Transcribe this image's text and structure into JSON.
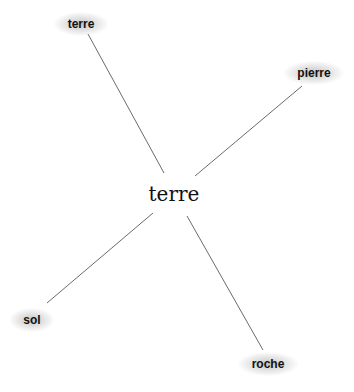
{
  "center": {
    "label": "terre",
    "x": 174,
    "y": 194
  },
  "nodes": [
    {
      "id": "n1",
      "label": "terre",
      "x": 81,
      "y": 24,
      "edge": {
        "x1": 88,
        "y1": 34,
        "x2": 164,
        "y2": 173
      }
    },
    {
      "id": "n2",
      "label": "pierre",
      "x": 314,
      "y": 73,
      "edge": {
        "x1": 302,
        "y1": 86,
        "x2": 195,
        "y2": 176
      }
    },
    {
      "id": "n3",
      "label": "sol",
      "x": 32,
      "y": 320,
      "edge": {
        "x1": 47,
        "y1": 303,
        "x2": 153,
        "y2": 213
      }
    },
    {
      "id": "n4",
      "label": "roche",
      "x": 268,
      "y": 364,
      "edge": {
        "x1": 263,
        "y1": 350,
        "x2": 187,
        "y2": 216
      }
    }
  ],
  "colors": {
    "edge": "#6b6b6b",
    "text": "#111111",
    "background": "#ffffff"
  }
}
